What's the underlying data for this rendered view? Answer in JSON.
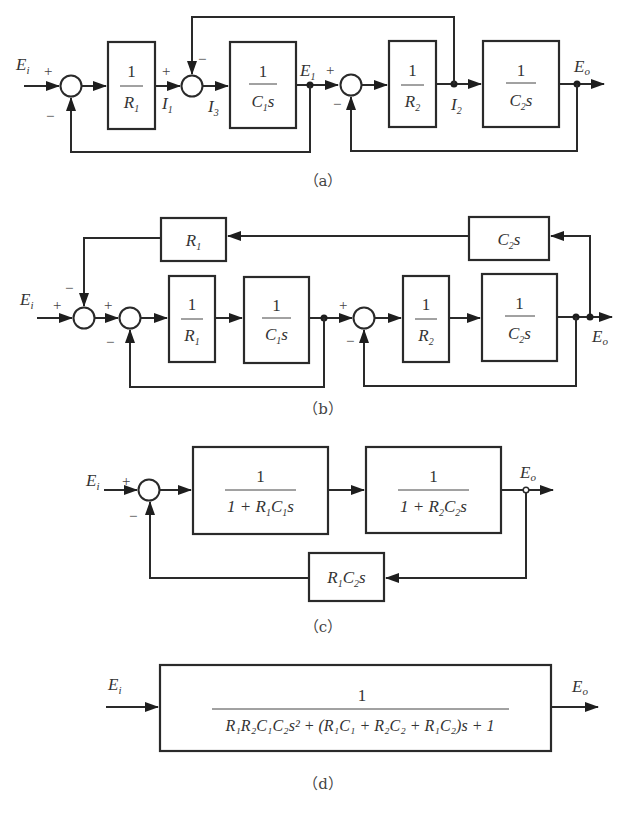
{
  "figure": {
    "subfigures": [
      {
        "id": "a",
        "caption": "（a）",
        "signals": {
          "input": "E",
          "input_sub": "i",
          "output": "E",
          "output_sub": "o",
          "e1": "E",
          "e1_sub": "1",
          "i1": "I",
          "i1_sub": "1",
          "i2": "I",
          "i2_sub": "2",
          "i3": "I",
          "i3_sub": "3"
        },
        "blocks": [
          {
            "num": "1",
            "den": "R",
            "den_sub": "1",
            "den_tail": ""
          },
          {
            "num": "1",
            "den": "C",
            "den_sub": "1",
            "den_tail": "s"
          },
          {
            "num": "1",
            "den": "R",
            "den_sub": "2",
            "den_tail": ""
          },
          {
            "num": "1",
            "den": "C",
            "den_sub": "2",
            "den_tail": "s"
          }
        ],
        "signs": {
          "s1_in": "+",
          "s1_fb": "−",
          "s2_in": "+",
          "s2_fb": "−",
          "s3_in": "+",
          "s3_fb": "−"
        }
      },
      {
        "id": "b",
        "caption": "（b）",
        "signals": {
          "input": "E",
          "input_sub": "i",
          "output": "E",
          "output_sub": "o"
        },
        "feedback_blocks": [
          {
            "label": "R",
            "sub": "1",
            "tail": ""
          },
          {
            "label": "C",
            "sub": "2",
            "tail": "s"
          }
        ],
        "blocks": [
          {
            "num": "1",
            "den": "R",
            "den_sub": "1",
            "den_tail": ""
          },
          {
            "num": "1",
            "den": "C",
            "den_sub": "1",
            "den_tail": "s"
          },
          {
            "num": "1",
            "den": "R",
            "den_sub": "2",
            "den_tail": ""
          },
          {
            "num": "1",
            "den": "C",
            "den_sub": "2",
            "den_tail": "s"
          }
        ],
        "signs": {
          "s1_in": "+",
          "s1_fb": "−",
          "s2_in": "+",
          "s2_fb": "−",
          "s3_in": "+",
          "s3_fb": "−"
        }
      },
      {
        "id": "c",
        "caption": "（c）",
        "signals": {
          "input": "E",
          "input_sub": "i",
          "output": "E",
          "output_sub": "o"
        },
        "blocks": [
          {
            "num": "1",
            "den_pre": "1 + R",
            "den_s1": "1",
            "den_mid": "C",
            "den_s2": "1",
            "den_tail": "s"
          },
          {
            "num": "1",
            "den_pre": "1 + R",
            "den_s1": "2",
            "den_mid": "C",
            "den_s2": "2",
            "den_tail": "s"
          }
        ],
        "feedback_block": {
          "a": "R",
          "a_sub": "1",
          "b": "C",
          "b_sub": "2",
          "tail": "s"
        },
        "signs": {
          "s1_in": "+",
          "s1_fb": "−"
        }
      },
      {
        "id": "d",
        "caption": "（d）",
        "signals": {
          "input": "E",
          "input_sub": "i",
          "output": "E",
          "output_sub": "o"
        },
        "block": {
          "num": "1",
          "den_text": "R₁R₂C₁C₂s² + (R₁C₁ + R₂C₂ + R₁C₂)s + 1"
        }
      }
    ]
  }
}
